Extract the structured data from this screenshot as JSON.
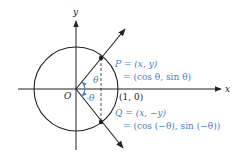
{
  "diagram": {
    "type": "unit-circle",
    "colors": {
      "stroke": "#222222",
      "accent": "#4a7fc0"
    },
    "axes": {
      "x_label": "x",
      "y_label": "y",
      "origin_label": "O",
      "unit_point_label": "(1, 0)"
    },
    "angles": {
      "positive": "θ",
      "negative": "-θ"
    },
    "points": {
      "P": {
        "name": "P",
        "line1": "P = (x, y)",
        "line2": "= (cos θ, sin θ)"
      },
      "Q": {
        "name": "Q",
        "line1": "Q = (x, −y)",
        "line2": "= (cos (−θ), sin (−θ))"
      }
    }
  }
}
